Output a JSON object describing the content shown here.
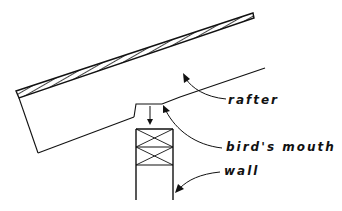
{
  "diagram": {
    "type": "architectural-section",
    "labels": {
      "rafter": "rafter",
      "birds_mouth": "bird's mouth",
      "wall": "wall"
    },
    "colors": {
      "line": "#111111",
      "background": "#ffffff"
    }
  }
}
